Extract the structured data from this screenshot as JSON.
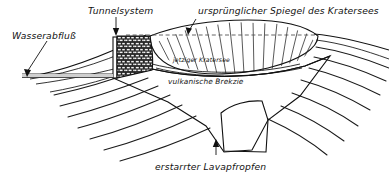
{
  "figure": {
    "kind": "geological-cross-section",
    "subject": "Kratersee",
    "language": "de"
  },
  "labels": {
    "wasserabfluss": "Wasserabfluß",
    "tunnelsystem": "Tunnelsystem",
    "urspruenglicher_spiegel": "ursprünglicher Spiegel des Kratersees",
    "jetziger_kratersee": "jetziger Kratersee",
    "vulkanische_brekzie": "vulkanische Brekzie",
    "erstarrter_lavapfropfen": "erstarrter Lavapfropfen"
  },
  "colors": {
    "ink": "#111111",
    "paper": "#ffffff",
    "lava_plug": "#4a4a4a",
    "tunnel_fill": "#2b2b2b",
    "breccia": "#ffffff",
    "water_level_line": "#555555"
  },
  "features": [
    {
      "id": "wasserabfluss",
      "name": "water outflow",
      "label": "Wasserabfluß"
    },
    {
      "id": "tunnelsystem",
      "name": "tunnel system",
      "label": "Tunnelsystem"
    },
    {
      "id": "original-level",
      "name": "original lake level",
      "label": "ursprünglicher Spiegel des Kratersees"
    },
    {
      "id": "current-lake",
      "name": "current crater lake",
      "label": "jetziger Kratersee"
    },
    {
      "id": "breccia",
      "name": "volcanic breccia",
      "label": "vulkanische Brekzie"
    },
    {
      "id": "lava-plug",
      "name": "solidified lava plug",
      "label": "erstarrter Lavapfropfen"
    }
  ]
}
